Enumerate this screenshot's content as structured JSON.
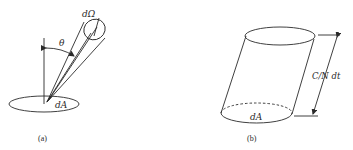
{
  "figure": {
    "panels": [
      {
        "id": "a",
        "caption": "(a)",
        "labels": {
          "solid_angle": "dΩ",
          "angle": "θ",
          "area": "dA"
        }
      },
      {
        "id": "b",
        "caption": "(b)",
        "labels": {
          "area": "dA",
          "height": "C/N dt"
        }
      }
    ],
    "colors": {
      "ink": "#2a2a2a",
      "background": "#ffffff"
    }
  }
}
